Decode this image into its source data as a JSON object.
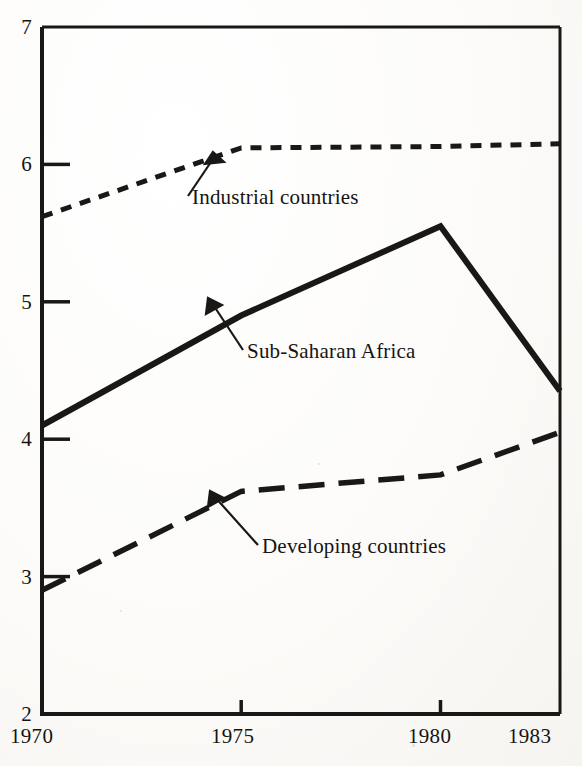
{
  "chart_data": {
    "type": "line",
    "title": "",
    "subtitle": "",
    "xlabel": "",
    "ylabel": "",
    "x": [
      1970,
      1975,
      1980,
      1983
    ],
    "xlim": [
      1970,
      1983
    ],
    "ylim": [
      2,
      7
    ],
    "y_ticks": [
      2,
      3,
      4,
      5,
      6,
      7
    ],
    "x_ticks": [
      1970,
      1975,
      1980,
      1983
    ],
    "x_tick_labels": [
      "1970",
      "1975",
      "1980",
      "1983"
    ],
    "y_tick_labels": [
      "2",
      "3",
      "4",
      "5",
      "6",
      "7"
    ],
    "grid": false,
    "legend_position": "inline-annotations",
    "series": [
      {
        "name": "Industrial countries",
        "style": "dotted",
        "color": "#1a1816",
        "values": [
          5.62,
          6.12,
          6.13,
          6.15
        ]
      },
      {
        "name": "Sub-Saharan Africa",
        "style": "solid",
        "color": "#1a1816",
        "values": [
          4.1,
          4.9,
          5.55,
          4.35
        ]
      },
      {
        "name": "Developing countries",
        "style": "dashed",
        "color": "#1a1816",
        "values": [
          2.9,
          3.62,
          3.74,
          4.05
        ]
      }
    ],
    "annotations": [
      {
        "text": "Industrial countries",
        "series": "Industrial countries",
        "points_to_x": 1974.1,
        "points_to_y": 6.08
      },
      {
        "text": "Sub-Saharan Africa",
        "series": "Sub-Saharan Africa",
        "points_to_x": 1974.3,
        "points_to_y": 4.82
      },
      {
        "text": "Developing countries",
        "series": "Developing countries",
        "points_to_x": 1975.5,
        "points_to_y": 3.6
      }
    ]
  },
  "axes": {
    "y_labels": [
      "7",
      "6",
      "5",
      "4",
      "3",
      "2"
    ],
    "x_labels": [
      "1970",
      "1975",
      "1980",
      "1983"
    ]
  },
  "labels": {
    "industrial": "Industrial countries",
    "subsaharan": "Sub-Saharan Africa",
    "developing": "Developing countries"
  }
}
